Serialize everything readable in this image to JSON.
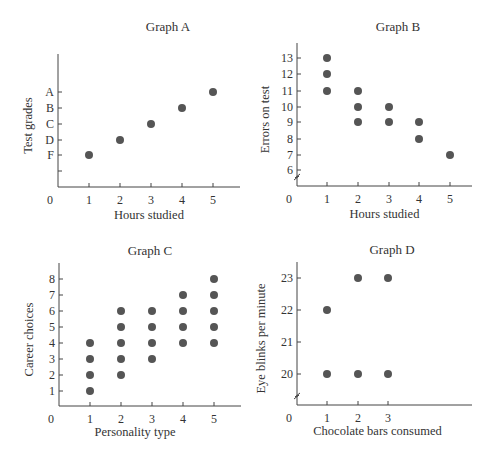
{
  "chart_data": [
    {
      "id": "A",
      "type": "scatter",
      "title": "Graph A",
      "xlabel": "Hours studied",
      "ylabel": "Test grades",
      "origin_label": "0",
      "x_ticks": [
        "1",
        "2",
        "3",
        "4",
        "5"
      ],
      "y_ticks": [
        "F",
        "D",
        "C",
        "B",
        "A"
      ],
      "y_tick_extra_unlabeled_below": true,
      "points": [
        {
          "x": 1,
          "y": "F"
        },
        {
          "x": 2,
          "y": "D"
        },
        {
          "x": 3,
          "y": "C"
        },
        {
          "x": 4,
          "y": "B"
        },
        {
          "x": 5,
          "y": "A"
        }
      ]
    },
    {
      "id": "B",
      "type": "scatter",
      "title": "Graph B",
      "xlabel": "Hours studied",
      "ylabel": "Errors on test",
      "origin_label": "0",
      "axis_break": true,
      "x_ticks": [
        "1",
        "2",
        "3",
        "4",
        "5"
      ],
      "y_ticks": [
        "6",
        "7",
        "8",
        "9",
        "10",
        "11",
        "12",
        "13"
      ],
      "points": [
        {
          "x": 1,
          "y": 13
        },
        {
          "x": 1,
          "y": 12
        },
        {
          "x": 1,
          "y": 11
        },
        {
          "x": 2,
          "y": 11
        },
        {
          "x": 2,
          "y": 10
        },
        {
          "x": 2,
          "y": 9
        },
        {
          "x": 3,
          "y": 10
        },
        {
          "x": 3,
          "y": 9
        },
        {
          "x": 4,
          "y": 9
        },
        {
          "x": 4,
          "y": 8
        },
        {
          "x": 5,
          "y": 7
        }
      ]
    },
    {
      "id": "C",
      "type": "scatter",
      "title": "Graph C",
      "xlabel": "Personality type",
      "ylabel": "Career choices",
      "origin_label": "0",
      "x_ticks": [
        "1",
        "2",
        "3",
        "4",
        "5"
      ],
      "y_ticks": [
        "1",
        "2",
        "3",
        "4",
        "5",
        "6",
        "7",
        "8"
      ],
      "points": [
        {
          "x": 1,
          "y": 1
        },
        {
          "x": 1,
          "y": 2
        },
        {
          "x": 1,
          "y": 3
        },
        {
          "x": 1,
          "y": 4
        },
        {
          "x": 2,
          "y": 2
        },
        {
          "x": 2,
          "y": 3
        },
        {
          "x": 2,
          "y": 4
        },
        {
          "x": 2,
          "y": 5
        },
        {
          "x": 2,
          "y": 6
        },
        {
          "x": 3,
          "y": 3
        },
        {
          "x": 3,
          "y": 4
        },
        {
          "x": 3,
          "y": 5
        },
        {
          "x": 3,
          "y": 6
        },
        {
          "x": 4,
          "y": 4
        },
        {
          "x": 4,
          "y": 5
        },
        {
          "x": 4,
          "y": 6
        },
        {
          "x": 4,
          "y": 7
        },
        {
          "x": 5,
          "y": 4
        },
        {
          "x": 5,
          "y": 5
        },
        {
          "x": 5,
          "y": 6
        },
        {
          "x": 5,
          "y": 7
        },
        {
          "x": 5,
          "y": 8
        }
      ]
    },
    {
      "id": "D",
      "type": "scatter",
      "title": "Graph D",
      "xlabel": "Chocolate bars consumed",
      "ylabel": "Eye blinks per minute",
      "origin_label": "0",
      "axis_break": true,
      "x_ticks": [
        "1",
        "2",
        "3"
      ],
      "y_ticks": [
        "20",
        "21",
        "22",
        "23"
      ],
      "points": [
        {
          "x": 1,
          "y": 20
        },
        {
          "x": 1,
          "y": 22
        },
        {
          "x": 2,
          "y": 20
        },
        {
          "x": 2,
          "y": 23
        },
        {
          "x": 3,
          "y": 20
        },
        {
          "x": 3,
          "y": 23
        }
      ]
    }
  ],
  "style": {
    "dot_color": "#555555",
    "axis_color": "#444444",
    "text_color": "#333333"
  }
}
